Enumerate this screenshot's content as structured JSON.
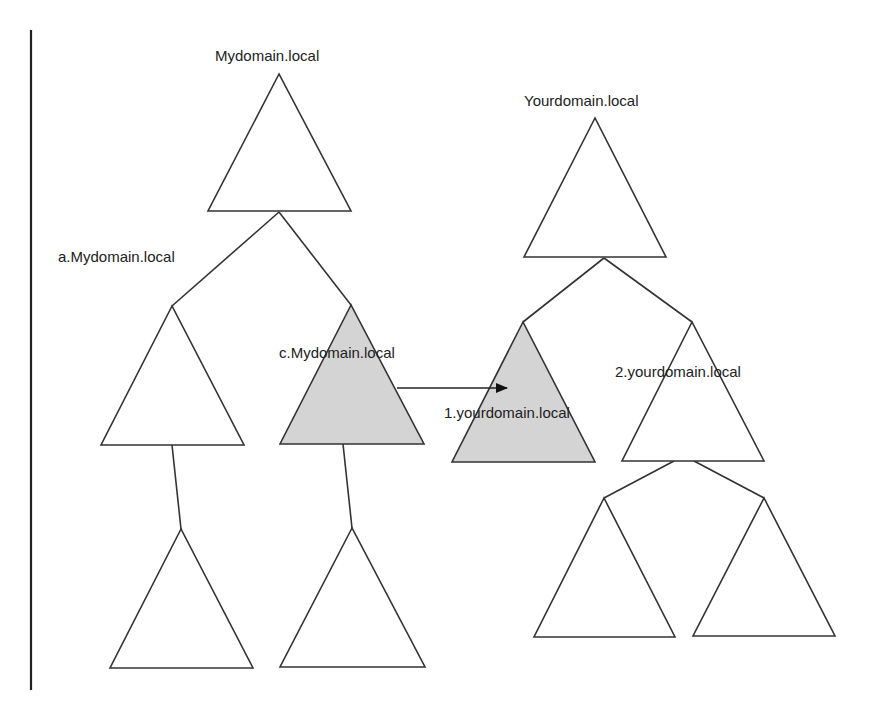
{
  "diagram": {
    "colors": {
      "line": "#333333",
      "fill_default": "#ffffff",
      "fill_highlight": "#d4d4d4",
      "text": "#222222"
    },
    "nodes": [
      {
        "id": "mydomain",
        "label": "Mydomain.local",
        "highlighted": false
      },
      {
        "id": "a-mydomain",
        "label": "a.Mydomain.local",
        "highlighted": false
      },
      {
        "id": "c-mydomain",
        "label": "c.Mydomain.local",
        "highlighted": true
      },
      {
        "id": "a-child",
        "label": "",
        "highlighted": false
      },
      {
        "id": "c-child",
        "label": "",
        "highlighted": false
      },
      {
        "id": "yourdomain",
        "label": "Yourdomain.local",
        "highlighted": false
      },
      {
        "id": "1-yourdomain",
        "label": "1.yourdomain.local",
        "highlighted": true
      },
      {
        "id": "2-yourdomain",
        "label": "2.yourdomain.local",
        "highlighted": false
      },
      {
        "id": "2-child-left",
        "label": "",
        "highlighted": false
      },
      {
        "id": "2-child-right",
        "label": "",
        "highlighted": false
      }
    ],
    "edges": [
      {
        "from": "mydomain",
        "to": "a-mydomain",
        "type": "tree"
      },
      {
        "from": "mydomain",
        "to": "c-mydomain",
        "type": "tree"
      },
      {
        "from": "a-mydomain",
        "to": "a-child",
        "type": "tree"
      },
      {
        "from": "c-mydomain",
        "to": "c-child",
        "type": "tree"
      },
      {
        "from": "yourdomain",
        "to": "1-yourdomain",
        "type": "tree"
      },
      {
        "from": "yourdomain",
        "to": "2-yourdomain",
        "type": "tree"
      },
      {
        "from": "2-yourdomain",
        "to": "2-child-left",
        "type": "tree"
      },
      {
        "from": "2-yourdomain",
        "to": "2-child-right",
        "type": "tree"
      },
      {
        "from": "c-mydomain",
        "to": "1-yourdomain",
        "type": "trust-arrow"
      }
    ]
  }
}
